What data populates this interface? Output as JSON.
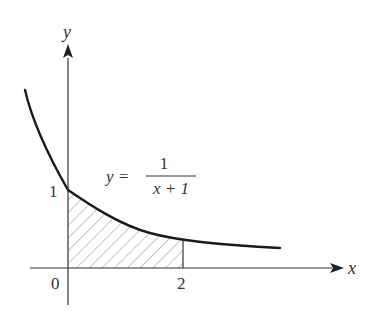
{
  "figure": {
    "type": "function-area-diagram",
    "axes": {
      "x_label": "x",
      "y_label": "y",
      "origin_label": "0"
    },
    "ticks": {
      "x": [
        {
          "value": 2,
          "label": "2"
        }
      ],
      "y": [
        {
          "value": 1,
          "label": "1"
        }
      ]
    },
    "curve": {
      "equation": "y = 1/(x + 1)",
      "lhs": "y =",
      "numerator": "1",
      "denominator": "x + 1"
    },
    "shaded_region": {
      "description": "area under curve from x = 0 to x = 2",
      "x_from": 0,
      "x_to": 2,
      "pattern": "diagonal hatch"
    },
    "colors": {
      "ink": "#222222",
      "hatch": "#8a8a8a",
      "background": "#ffffff"
    }
  }
}
